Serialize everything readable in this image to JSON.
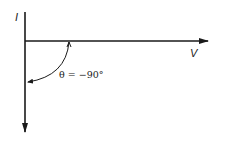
{
  "diagram": {
    "labels": {
      "current_axis": "I",
      "voltage_axis": "V",
      "angle": "θ = −90°"
    },
    "colors": {
      "line": "#1a1a1a",
      "text": "#222222",
      "background": "#ffffff"
    }
  }
}
